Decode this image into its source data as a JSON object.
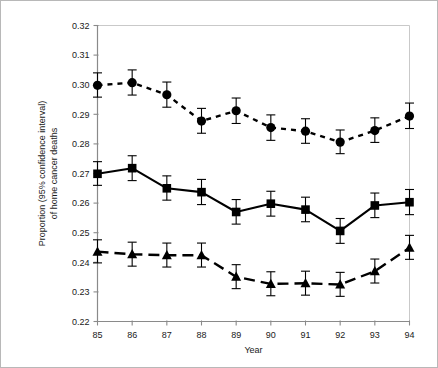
{
  "chart_data": {
    "type": "line",
    "title": "",
    "xlabel": "Year",
    "ylabel": "Proportion (95% confidence interval) of home cancer deaths",
    "ylabel_line1": "Proportion (95% confidence interval)",
    "ylabel_line2": "of home cancer deaths",
    "categories": [
      "85",
      "86",
      "87",
      "88",
      "89",
      "90",
      "91",
      "92",
      "93",
      "94"
    ],
    "x": [
      85,
      86,
      87,
      88,
      89,
      90,
      91,
      92,
      93,
      94
    ],
    "xlim": [
      85,
      94
    ],
    "ylim": [
      0.22,
      0.32
    ],
    "yticks": [
      0.22,
      0.23,
      0.24,
      0.25,
      0.26,
      0.27,
      0.28,
      0.29,
      0.3,
      0.31,
      0.32
    ],
    "ytick_labels": [
      "0.22",
      "0.23",
      "0.24",
      "0.25",
      "0.26",
      "0.27",
      "0.28",
      "0.29",
      "0.30",
      "0.31",
      "0.32"
    ],
    "xtick_labels": [
      "85",
      "86",
      "87",
      "88",
      "89",
      "90",
      "91",
      "92",
      "93",
      "94"
    ],
    "grid": false,
    "legend": "none",
    "marker_color": "#000000",
    "series": [
      {
        "name": "circle-series",
        "marker": "circle",
        "linestyle": "dotted",
        "values": [
          0.2998,
          0.3007,
          0.2966,
          0.2877,
          0.2912,
          0.2855,
          0.2843,
          0.2806,
          0.2845,
          0.2894
        ],
        "ci_lower": [
          0.2958,
          0.2965,
          0.2924,
          0.2836,
          0.2869,
          0.2812,
          0.2802,
          0.2767,
          0.2805,
          0.2852
        ],
        "ci_upper": [
          0.304,
          0.305,
          0.3009,
          0.292,
          0.2955,
          0.2898,
          0.2885,
          0.2847,
          0.2888,
          0.2938
        ]
      },
      {
        "name": "square-series",
        "marker": "square",
        "linestyle": "solid",
        "values": [
          0.2699,
          0.2718,
          0.265,
          0.2637,
          0.257,
          0.2598,
          0.2578,
          0.2506,
          0.2592,
          0.2603
        ],
        "ci_lower": [
          0.266,
          0.2676,
          0.261,
          0.2595,
          0.2529,
          0.2556,
          0.2537,
          0.2464,
          0.2551,
          0.2561
        ],
        "ci_upper": [
          0.274,
          0.276,
          0.2692,
          0.268,
          0.2612,
          0.264,
          0.262,
          0.2548,
          0.2634,
          0.2646
        ]
      },
      {
        "name": "triangle-series",
        "marker": "triangle",
        "linestyle": "dashed",
        "values": [
          0.2436,
          0.2427,
          0.2424,
          0.2424,
          0.2351,
          0.2327,
          0.2329,
          0.2325,
          0.237,
          0.2449
        ],
        "ci_lower": [
          0.2398,
          0.2387,
          0.2384,
          0.2384,
          0.2311,
          0.2287,
          0.2289,
          0.2285,
          0.233,
          0.241
        ],
        "ci_upper": [
          0.2476,
          0.2468,
          0.2465,
          0.2465,
          0.2392,
          0.2368,
          0.237,
          0.2366,
          0.2411,
          0.2491
        ]
      }
    ]
  }
}
